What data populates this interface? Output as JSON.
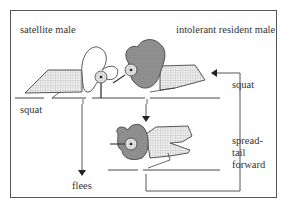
{
  "diagram": {
    "type": "behavioral-sequence",
    "labels": {
      "satellite": "satellite male",
      "resident": "intolerant resident male",
      "squat_left": "squat",
      "squat_right": "squat",
      "spread_line1": "spread-",
      "spread_line2": "tail",
      "spread_line3": "forward",
      "flees": "flees"
    },
    "colors": {
      "line": "#444444",
      "frame": "#555555",
      "stipple_dark": "#8a8a8a",
      "grid_light": "#c8c8c8",
      "text": "#333333"
    }
  }
}
